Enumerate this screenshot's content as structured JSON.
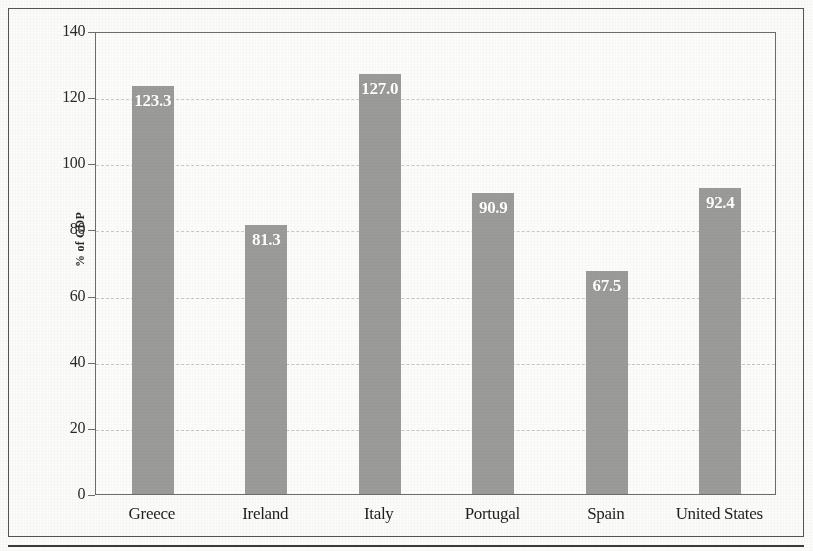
{
  "chart_data": {
    "type": "bar",
    "title": "",
    "xlabel": "",
    "ylabel": "% of GDP",
    "categories": [
      "Greece",
      "Ireland",
      "Italy",
      "Portugal",
      "Spain",
      "United States"
    ],
    "values": [
      123.3,
      81.3,
      127.0,
      90.9,
      67.5,
      92.4
    ],
    "value_labels": [
      "123.3",
      "81.3",
      "127.0",
      "90.9",
      "67.5",
      "92.4"
    ],
    "ylim": [
      0,
      140
    ],
    "yticks": [
      0,
      20,
      40,
      60,
      80,
      100,
      120,
      140
    ],
    "ytick_labels": [
      "0",
      "20",
      "40",
      "60",
      "80",
      "100",
      "120",
      "140"
    ],
    "grid": true,
    "grid_style": "dashed-horizontal",
    "legend": null,
    "legend_position": "none",
    "series": [
      {
        "name": "Gross government debt",
        "values": [
          123.3,
          81.3,
          127.0,
          90.9,
          67.5,
          92.4
        ]
      }
    ]
  },
  "style": {
    "bar_color": "#9b9b99",
    "bar_label_color": "#ffffff",
    "grid_color": "#c9c8c5",
    "axis_color": "#6d6c6a",
    "frame_color": "#555452",
    "page_background": "#fbfbf9",
    "plot_background": "#fcfcfb",
    "text_color": "#1f1f1d"
  }
}
